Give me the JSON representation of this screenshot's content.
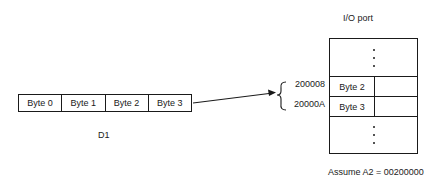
{
  "title": "I/O port",
  "register": {
    "name": "D1",
    "cells": [
      "Byte 0",
      "Byte 1",
      "Byte 2",
      "Byte 3"
    ]
  },
  "memory": {
    "rows": [
      {
        "address": "200008",
        "content": "Byte 2"
      },
      {
        "address": "20000A",
        "content": "Byte 3"
      }
    ]
  },
  "note": "Assume A2 = 00200000",
  "colors": {
    "line": "#1a1a1a",
    "background": "#ffffff"
  }
}
